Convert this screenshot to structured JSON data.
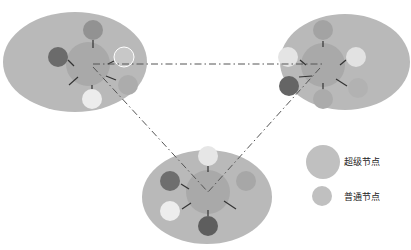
{
  "diagram": {
    "type": "p2p-super-node-topology",
    "colors": {
      "cluster_bg": "#b9b9b9",
      "super_node": "#a9a9a9",
      "node_dark": "#6b6b6b",
      "node_mid": "#9a9a9a",
      "node_light": "#e8e8e8",
      "node_gray": "#a5a5a5",
      "spoke": "#333333",
      "link": "#555555"
    },
    "clusters": [
      {
        "id": "left",
        "cx": 75,
        "cy": 62,
        "rx": 72,
        "ry": 50,
        "super": {
          "cx": 88,
          "cy": 64,
          "r": 22
        },
        "nodes": [
          {
            "cx": 93,
            "cy": 30,
            "r": 10,
            "tone": "node_mid"
          },
          {
            "cx": 58,
            "cy": 57,
            "r": 10,
            "tone": "node_dark"
          },
          {
            "cx": 124,
            "cy": 57,
            "r": 10,
            "tone": "node_light_outline"
          },
          {
            "cx": 128,
            "cy": 85,
            "r": 10,
            "tone": "node_gray"
          },
          {
            "cx": 92,
            "cy": 99,
            "r": 10,
            "tone": "node_light"
          }
        ]
      },
      {
        "id": "right",
        "cx": 345,
        "cy": 62,
        "rx": 65,
        "ry": 48,
        "super": {
          "cx": 323,
          "cy": 65,
          "r": 22
        },
        "nodes": [
          {
            "cx": 323,
            "cy": 30,
            "r": 10,
            "tone": "node_mid"
          },
          {
            "cx": 288,
            "cy": 57,
            "r": 10,
            "tone": "node_light"
          },
          {
            "cx": 356,
            "cy": 57,
            "r": 10,
            "tone": "node_light"
          },
          {
            "cx": 289,
            "cy": 86,
            "r": 10,
            "tone": "node_dark"
          },
          {
            "cx": 323,
            "cy": 99,
            "r": 10,
            "tone": "node_gray"
          },
          {
            "cx": 358,
            "cy": 88,
            "r": 10,
            "tone": "node_gray"
          }
        ]
      },
      {
        "id": "bottom",
        "cx": 207,
        "cy": 197,
        "rx": 65,
        "ry": 47,
        "super": {
          "cx": 208,
          "cy": 192,
          "r": 22
        },
        "nodes": [
          {
            "cx": 208,
            "cy": 156,
            "r": 10,
            "tone": "node_light"
          },
          {
            "cx": 170,
            "cy": 181,
            "r": 10,
            "tone": "node_dark"
          },
          {
            "cx": 246,
            "cy": 181,
            "r": 10,
            "tone": "node_gray"
          },
          {
            "cx": 170,
            "cy": 211,
            "r": 10,
            "tone": "node_light"
          },
          {
            "cx": 208,
            "cy": 226,
            "r": 10,
            "tone": "node_dark"
          }
        ]
      }
    ],
    "links": [
      {
        "from": "left",
        "to": "right",
        "style": "dash-dot"
      },
      {
        "from": "left",
        "to": "bottom",
        "style": "dash-dot"
      },
      {
        "from": "right",
        "to": "bottom",
        "style": "dash-dot"
      }
    ]
  },
  "legend": {
    "super_node_label": "超级节点",
    "normal_node_label": "普通节点"
  }
}
